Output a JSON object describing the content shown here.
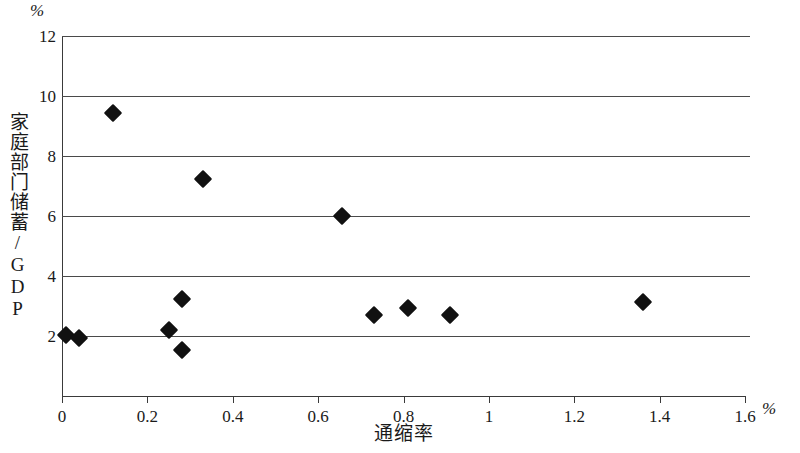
{
  "chart_data": {
    "type": "scatter",
    "title": "",
    "xlabel": "通缩率",
    "ylabel": "家庭部门储蓄/GDP",
    "x_unit": "%",
    "y_unit": "%",
    "xlim": [
      0,
      1.6
    ],
    "ylim": [
      0,
      12
    ],
    "x_ticks": [
      "0",
      "0.2",
      "0.4",
      "0.6",
      "0.8",
      "1",
      "1.2",
      "1.4",
      "1.6"
    ],
    "x_tick_values": [
      0,
      0.2,
      0.4,
      0.6,
      0.8,
      1,
      1.2,
      1.4,
      1.6
    ],
    "y_ticks": [
      "2",
      "4",
      "6",
      "8",
      "10",
      "12"
    ],
    "y_tick_values": [
      2,
      4,
      6,
      8,
      10,
      12
    ],
    "grid": "horizontal",
    "legend": "none",
    "marker": "filled-diamond",
    "marker_color": "#111111",
    "points": [
      {
        "x": 0.01,
        "y": 2.05
      },
      {
        "x": 0.04,
        "y": 1.95
      },
      {
        "x": 0.12,
        "y": 9.45
      },
      {
        "x": 0.25,
        "y": 2.2
      },
      {
        "x": 0.28,
        "y": 3.25
      },
      {
        "x": 0.28,
        "y": 1.55
      },
      {
        "x": 0.33,
        "y": 7.25
      },
      {
        "x": 0.655,
        "y": 6.0
      },
      {
        "x": 0.73,
        "y": 2.7
      },
      {
        "x": 0.81,
        "y": 2.95
      },
      {
        "x": 0.91,
        "y": 2.7
      },
      {
        "x": 1.36,
        "y": 3.15
      }
    ]
  }
}
